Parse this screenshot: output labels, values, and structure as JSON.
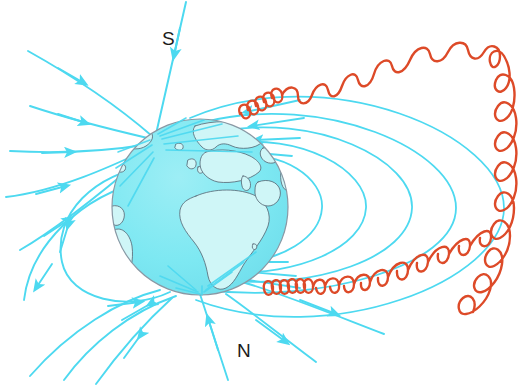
{
  "figure": {
    "width": 530,
    "height": 392,
    "background_color": "#FFFFFF"
  },
  "labels": {
    "south_pole": "S",
    "north_pole": "N"
  },
  "label_positions": {
    "south_pole": {
      "x": 162,
      "y": 45
    },
    "north_pole": {
      "x": 237,
      "y": 357
    }
  },
  "colors": {
    "field_line": "#4DD9F0",
    "field_line_light": "#6FE0F4",
    "solar_wind": "#DD4A28",
    "ocean": "#7DE8F2",
    "land": "#CFF6F7",
    "coastline": "#5A6B78",
    "globe_outline": "#8A98A4",
    "label_text": "#1B1B1B",
    "background": "#FFFFFF"
  },
  "globe": {
    "name": "earth",
    "center_x": 200,
    "center_y": 207,
    "radius": 88,
    "ocean_color": "#7DE8F2",
    "land_color": "#CFF6F7",
    "outline_color": "#8A98A4",
    "magnetic_north_pole": {
      "x": 158,
      "y": 140
    },
    "magnetic_south_pole": {
      "x": 200,
      "y": 295
    }
  },
  "elements": {
    "field_lines_label": "magnetic field lines",
    "solar_wind_label": "solar wind / charged particle spiral",
    "magnetopause_label": "magnetopause boundary",
    "globe_label": "Earth globe with continents"
  },
  "field_lines": {
    "description": "Dipole magnetic field lines entering at the magnetic north pole (upper-left, labelled S) and exiting at the magnetic south pole (lower, labelled N), compressed on the left and stretched into a magnetotail on the right.",
    "inbound_count": 6,
    "outbound_count": 6,
    "closed_loop_count": 8
  },
  "solar_wind": {
    "description": "Two helical orange-red particle trajectories spiralling along the outermost field line, tightly coiled near Earth and stretching out toward the right.",
    "trails": 2,
    "color": "#DD4A28"
  },
  "legend": {
    "field_line_caption": "magnetic field line",
    "solar_wind_caption": "charged particle spiral"
  }
}
